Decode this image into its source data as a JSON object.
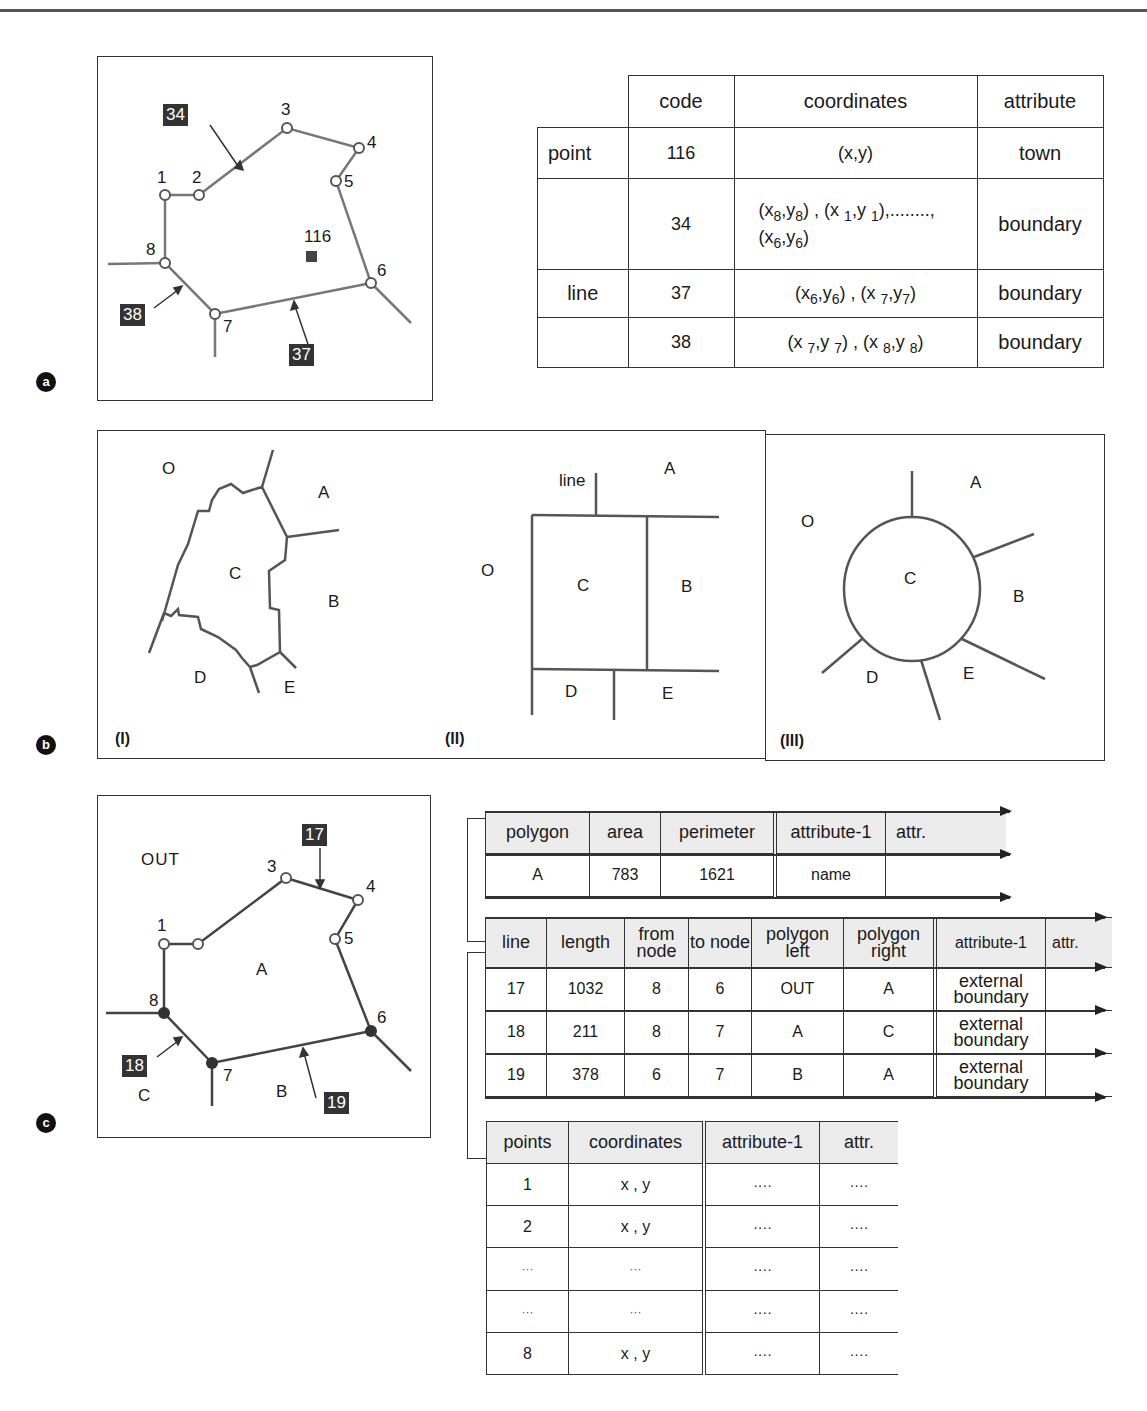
{
  "figure": {
    "panel_labels": [
      "a",
      "b",
      "c"
    ]
  },
  "section_a": {
    "map": {
      "nodes": [
        "1",
        "2",
        "3",
        "4",
        "5",
        "6",
        "7",
        "8"
      ],
      "point_code": "116",
      "line_tags": [
        "34",
        "38",
        "37"
      ]
    },
    "table": {
      "headers": [
        "",
        "code",
        "coordinates",
        "attribute"
      ],
      "rows": [
        {
          "type": "point",
          "code": "116",
          "coordinates": "(x,y)",
          "attribute": "town"
        },
        {
          "type": "",
          "code": "34",
          "coordinates": "(x8,y8) , (x 1,y 1),........, (x6,y6)",
          "attribute": "boundary"
        },
        {
          "type": "line",
          "code": "37",
          "coordinates": "(x6,y6) , (x 7,y7)",
          "attribute": "boundary"
        },
        {
          "type": "",
          "code": "38",
          "coordinates": "(x 7,y 7) , (x 8,y 8)",
          "attribute": "boundary"
        }
      ]
    }
  },
  "section_b": {
    "panels": [
      {
        "id": "(I)",
        "regions": [
          "O",
          "A",
          "C",
          "B",
          "D",
          "E"
        ]
      },
      {
        "id": "(II)",
        "regions": [
          "A",
          "O",
          "C",
          "B",
          "D",
          "E"
        ],
        "line_label": "line"
      },
      {
        "id": "(III)",
        "regions": [
          "A",
          "O",
          "C",
          "B",
          "D",
          "E"
        ]
      }
    ]
  },
  "section_c": {
    "map": {
      "outside_label": "OUT",
      "nodes": [
        "1",
        "3",
        "4",
        "5",
        "6",
        "7",
        "8"
      ],
      "regions": [
        "A",
        "B",
        "C"
      ],
      "line_tags": [
        "17",
        "18",
        "19"
      ]
    },
    "polygon_table": {
      "headers": [
        "polygon",
        "area",
        "perimeter",
        "attribute-1",
        "attr."
      ],
      "rows": [
        [
          "A",
          "783",
          "1621",
          "name",
          ""
        ]
      ]
    },
    "line_table": {
      "headers": [
        "line",
        "length",
        "from node",
        "to node",
        "polygon left",
        "polygon right",
        "attribute-1",
        "attr."
      ],
      "rows": [
        [
          "17",
          "1032",
          "8",
          "6",
          "OUT",
          "A",
          "external boundary",
          ""
        ],
        [
          "18",
          "211",
          "8",
          "7",
          "A",
          "C",
          "external boundary",
          ""
        ],
        [
          "19",
          "378",
          "6",
          "7",
          "B",
          "A",
          "external boundary",
          ""
        ]
      ]
    },
    "points_table": {
      "headers": [
        "points",
        "coordinates",
        "attribute-1",
        "attr."
      ],
      "rows": [
        [
          "1",
          "x , y",
          "····",
          "····"
        ],
        [
          "2",
          "x , y",
          "····",
          "····"
        ],
        [
          "···",
          "···",
          "····",
          "····"
        ],
        [
          "···",
          "···",
          "····",
          "····"
        ],
        [
          "8",
          "x , y",
          "····",
          "····"
        ]
      ]
    }
  }
}
